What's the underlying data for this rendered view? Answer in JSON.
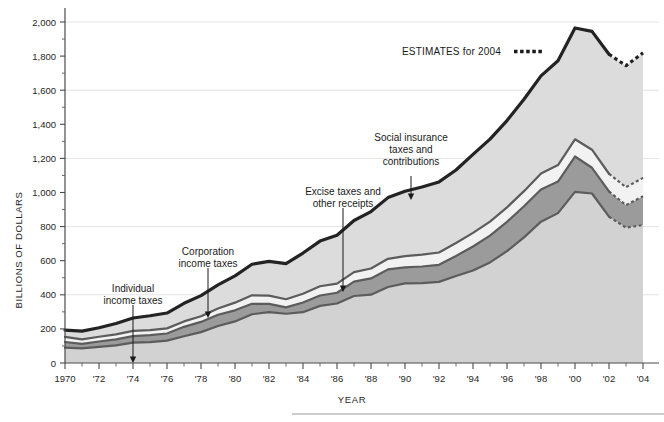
{
  "chart_data": {
    "type": "area",
    "title": "",
    "xlabel": "YEAR",
    "ylabel": "BILLIONS OF DOLLARS",
    "xlim": [
      1970,
      2004
    ],
    "ylim": [
      0,
      2000
    ],
    "grid": true,
    "legend_position": "inline-annotations",
    "x": [
      1970,
      1971,
      1972,
      1973,
      1974,
      1975,
      1976,
      1977,
      1978,
      1979,
      1980,
      1981,
      1982,
      1983,
      1984,
      1985,
      1986,
      1987,
      1988,
      1989,
      1990,
      1991,
      1992,
      1993,
      1994,
      1995,
      1996,
      1997,
      1998,
      1999,
      2000,
      2001,
      2002,
      2003,
      2004
    ],
    "estimate_start_year": 2002,
    "y_ticks": [
      0,
      200,
      400,
      600,
      800,
      1000,
      1200,
      1400,
      1600,
      1800,
      2000
    ],
    "y_tick_labels": [
      "0",
      "200",
      "400",
      "600",
      "800",
      "1,000",
      "1,200",
      "1,400",
      "1,600",
      "1,800",
      "2,000"
    ],
    "x_tick_labels": [
      "1970",
      "'72",
      "'74",
      "'76",
      "'78",
      "'80",
      "'82",
      "'84",
      "'86",
      "'88",
      "'90",
      "'92",
      "'94",
      "'96",
      "'98",
      "'00",
      "'02",
      "'04"
    ],
    "x_tick_years": [
      1970,
      1972,
      1974,
      1976,
      1978,
      1980,
      1982,
      1984,
      1986,
      1988,
      1990,
      1992,
      1994,
      1996,
      1998,
      2000,
      2002,
      2004
    ],
    "series": [
      {
        "name": "Individual income taxes",
        "color": "#d2d2d2",
        "values": [
          90,
          86,
          94,
          103,
          119,
          122,
          131,
          157,
          181,
          217,
          244,
          286,
          298,
          289,
          298,
          335,
          349,
          393,
          401,
          446,
          467,
          468,
          476,
          510,
          543,
          590,
          656,
          737,
          829,
          879,
          1004,
          994,
          858,
          794,
          809
        ]
      },
      {
        "name": "Corporation income taxes",
        "color": "#9b9b9b",
        "values": [
          33,
          26,
          32,
          36,
          39,
          41,
          42,
          55,
          60,
          66,
          65,
          61,
          49,
          37,
          57,
          61,
          63,
          84,
          95,
          103,
          94,
          98,
          100,
          118,
          140,
          157,
          172,
          182,
          189,
          185,
          207,
          151,
          148,
          132,
          169
        ]
      },
      {
        "name": "Excise taxes and other receipts",
        "color": "#f2f2f2",
        "values": [
          30,
          27,
          28,
          29,
          30,
          30,
          30,
          32,
          33,
          37,
          45,
          50,
          48,
          48,
          51,
          54,
          54,
          56,
          58,
          62,
          66,
          70,
          72,
          76,
          80,
          82,
          85,
          89,
          94,
          97,
          101,
          106,
          104,
          105,
          108
        ]
      },
      {
        "name": "Social insurance taxes and contributions",
        "color": "#dcdcdc",
        "values": [
          40,
          48,
          53,
          64,
          76,
          84,
          90,
          106,
          121,
          138,
          157,
          182,
          201,
          209,
          239,
          265,
          283,
          303,
          334,
          359,
          380,
          396,
          414,
          428,
          461,
          484,
          509,
          539,
          572,
          612,
          653,
          694,
          701,
          713,
          733
        ]
      }
    ],
    "totals": [
      193,
      187,
      207,
      232,
      264,
      277,
      293,
      350,
      395,
      458,
      511,
      579,
      596,
      583,
      645,
      715,
      749,
      836,
      888,
      970,
      1007,
      1032,
      1062,
      1132,
      1224,
      1313,
      1422,
      1547,
      1684,
      1773,
      1965,
      1945,
      1811,
      1744,
      1819
    ],
    "annotations": [
      {
        "name": "individual-income-taxes",
        "label": "Individual\nincome taxes",
        "lines": [
          "Individual",
          "income taxes"
        ],
        "x": 133,
        "y": 292,
        "arrow_from_y": 305,
        "arrow_to_y": 363
      },
      {
        "name": "corporation-income-taxes",
        "label": "Corporation\nincome taxes",
        "lines": [
          "Corporation",
          "income taxes"
        ],
        "x": 208,
        "y": 255,
        "arrow_from_y": 268,
        "arrow_to_y": 318
      },
      {
        "name": "excise-taxes-and-other-receipts",
        "label": "Excise taxes and\nother receipts",
        "lines": [
          "Excise taxes and",
          "other receipts"
        ],
        "x": 343,
        "y": 195,
        "arrow_from_y": 208,
        "arrow_to_y": 292
      },
      {
        "name": "social-insurance-taxes",
        "label": "Social insurance\ntaxes and\ncontributions",
        "lines": [
          "Social insurance",
          "taxes and",
          "contributions"
        ],
        "x": 411,
        "y": 141,
        "arrow_from_y": 176,
        "arrow_to_y": 200
      }
    ],
    "legend": {
      "text": "ESTIMATES for 2004",
      "swatch": "dotted-line",
      "x": 402,
      "y": 55
    }
  }
}
